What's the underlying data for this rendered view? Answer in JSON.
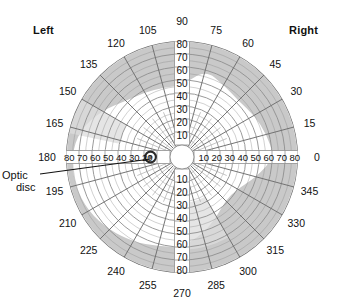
{
  "figure": {
    "title_visible": false,
    "side_labels": {
      "left": "Left",
      "right": "Right"
    },
    "annotation": {
      "line1": "Optic",
      "line2": "disc"
    }
  },
  "colors": {
    "background": "#ffffff",
    "grid": "#8f8f8f",
    "grid_major": "#6e6e6e",
    "shade": "#c9c9c9",
    "shade_light": "#dcdcdc",
    "text": "#111111",
    "optic_disc_ring": "#2b2b2b",
    "optic_disc_fill": "#6f6f6f"
  },
  "geometry": {
    "center_x": 182,
    "center_y": 157,
    "outer_radius": 116,
    "inner_blank_radius": 12,
    "ring_step_deg": 10,
    "spoke_step_deg": 15
  },
  "chart_data": {
    "type": "scatter",
    "subtitle": "Perimetry chart with eccentricity rings and meridian spokes",
    "xlabel": "",
    "ylabel": "",
    "coordinate_system": "polar",
    "grid": true,
    "legend_position": "none",
    "radial_axis": {
      "name": "Eccentricity (degrees)",
      "ticks": [
        10,
        20,
        30,
        40,
        50,
        60,
        70,
        80
      ],
      "rlim": [
        0,
        80
      ],
      "tick_labels_along": [
        "up (90°)",
        "down (270°)",
        "left (180°)",
        "right (0°)"
      ],
      "labels_up": [
        "80",
        "70",
        "60",
        "50",
        "40",
        "30",
        "20",
        "10"
      ],
      "labels_down": [
        "10",
        "20",
        "30",
        "40",
        "50",
        "60",
        "70",
        "80"
      ],
      "labels_left": [
        "80",
        "70",
        "60",
        "50",
        "40",
        "30",
        "20"
      ],
      "labels_right": [
        "10",
        "20",
        "30",
        "40",
        "50",
        "60",
        "70",
        "80"
      ]
    },
    "angular_axis": {
      "name": "Meridian (degrees)",
      "step": 15,
      "ticks": [
        0,
        15,
        30,
        45,
        60,
        75,
        90,
        105,
        120,
        135,
        150,
        165,
        180,
        195,
        210,
        225,
        240,
        255,
        270,
        285,
        300,
        315,
        330,
        345
      ],
      "tick_labels": [
        "0",
        "15",
        "30",
        "45",
        "60",
        "75",
        "90",
        "105",
        "120",
        "135",
        "150",
        "165",
        "180",
        "195",
        "210",
        "225",
        "240",
        "255",
        "270",
        "285",
        "300",
        "315",
        "330",
        "345"
      ]
    },
    "annotations": [
      {
        "label": "Optic disc",
        "angle_deg": 180,
        "radius_deg": 15,
        "marker": "ringed-dot"
      },
      {
        "label": "Left",
        "position": "top-left"
      },
      {
        "label": "Right",
        "position": "top-right"
      }
    ],
    "series": [
      {
        "name": "Outer field boundary (shaded band outer edge)",
        "type": "polar-outline",
        "points_deg_r": [
          [
            0,
            80
          ],
          [
            15,
            80
          ],
          [
            30,
            80
          ],
          [
            45,
            80
          ],
          [
            60,
            80
          ],
          [
            75,
            80
          ],
          [
            90,
            80
          ],
          [
            105,
            80
          ],
          [
            120,
            80
          ],
          [
            135,
            80
          ],
          [
            150,
            80
          ],
          [
            165,
            80
          ],
          [
            180,
            80
          ],
          [
            195,
            80
          ],
          [
            210,
            80
          ],
          [
            225,
            80
          ],
          [
            240,
            80
          ],
          [
            255,
            80
          ],
          [
            270,
            80
          ],
          [
            285,
            80
          ],
          [
            300,
            80
          ],
          [
            315,
            80
          ],
          [
            330,
            80
          ],
          [
            345,
            80
          ]
        ]
      },
      {
        "name": "Shaded crescent inner edge (monocular/temporal crescent)",
        "type": "polar-outline",
        "points_deg_r": [
          [
            0,
            62
          ],
          [
            15,
            58
          ],
          [
            30,
            55
          ],
          [
            45,
            52
          ],
          [
            60,
            55
          ],
          [
            75,
            60
          ],
          [
            90,
            46
          ],
          [
            105,
            46
          ],
          [
            120,
            48
          ],
          [
            135,
            52
          ],
          [
            150,
            62
          ],
          [
            165,
            72
          ],
          [
            180,
            76
          ],
          [
            195,
            76
          ],
          [
            210,
            74
          ],
          [
            225,
            70
          ],
          [
            240,
            66
          ],
          [
            255,
            62
          ],
          [
            270,
            60
          ],
          [
            285,
            52
          ],
          [
            300,
            44
          ],
          [
            315,
            38
          ],
          [
            330,
            40
          ],
          [
            345,
            50
          ]
        ]
      }
    ]
  },
  "radial_labels": {
    "up": [
      "80",
      "70",
      "60",
      "50",
      "40",
      "30",
      "20",
      "10"
    ],
    "down": [
      "10",
      "20",
      "30",
      "40",
      "50",
      "60",
      "70",
      "80"
    ],
    "left": [
      "80",
      "70",
      "60",
      "50",
      "40",
      "30",
      "20"
    ],
    "right": [
      "10",
      "20",
      "30",
      "40",
      "50",
      "60",
      "70",
      "80"
    ]
  },
  "angle_labels": [
    {
      "value": "0",
      "deg": 0
    },
    {
      "value": "15",
      "deg": 15
    },
    {
      "value": "30",
      "deg": 30
    },
    {
      "value": "45",
      "deg": 45
    },
    {
      "value": "60",
      "deg": 60
    },
    {
      "value": "75",
      "deg": 75
    },
    {
      "value": "90",
      "deg": 90
    },
    {
      "value": "105",
      "deg": 105
    },
    {
      "value": "120",
      "deg": 120
    },
    {
      "value": "135",
      "deg": 135
    },
    {
      "value": "150",
      "deg": 150
    },
    {
      "value": "165",
      "deg": 165
    },
    {
      "value": "180",
      "deg": 180
    },
    {
      "value": "195",
      "deg": 195
    },
    {
      "value": "210",
      "deg": 210
    },
    {
      "value": "225",
      "deg": 225
    },
    {
      "value": "240",
      "deg": 240
    },
    {
      "value": "255",
      "deg": 255
    },
    {
      "value": "270",
      "deg": 270
    },
    {
      "value": "285",
      "deg": 285
    },
    {
      "value": "300",
      "deg": 300
    },
    {
      "value": "315",
      "deg": 315
    },
    {
      "value": "330",
      "deg": 330
    },
    {
      "value": "345",
      "deg": 345
    }
  ]
}
